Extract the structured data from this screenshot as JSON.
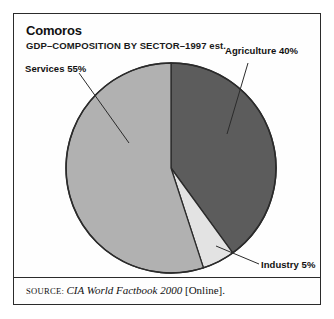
{
  "figure": {
    "title": "Comoros",
    "subtitle": "GDP–COMPOSITION BY SECTOR–1997 est.",
    "frame_color": "#2b2b2b",
    "background": "#ffffff"
  },
  "labels": {
    "agriculture": "Agriculture 40%",
    "services": "Services 55%",
    "industry": "Industry 5%"
  },
  "source": {
    "word": "SOURCE:",
    "title": "CIA World Factbook 2000",
    "suffix": "[Online]."
  },
  "chart_data": {
    "type": "pie",
    "title": "Comoros",
    "subtitle": "GDP–COMPOSITION BY SECTOR–1997 est.",
    "unit": "percent",
    "start_angle_deg": 0,
    "direction": "clockwise",
    "legend": "none",
    "grid": false,
    "labels_placement": "outside-with-leader-lines",
    "categories": [
      "Agriculture",
      "Industry",
      "Services"
    ],
    "values": [
      40,
      5,
      55
    ],
    "colors": [
      "#5c5c5c",
      "#e3e3e3",
      "#b1b1b1"
    ],
    "slices": [
      {
        "name": "Agriculture",
        "value": 40,
        "label": "Agriculture 40%",
        "color": "#5c5c5c"
      },
      {
        "name": "Industry",
        "value": 5,
        "label": "Industry 5%",
        "color": "#e3e3e3"
      },
      {
        "name": "Services",
        "value": 55,
        "label": "Services 55%",
        "color": "#b1b1b1"
      }
    ],
    "total": 100,
    "xlabel": "",
    "ylabel": ""
  }
}
